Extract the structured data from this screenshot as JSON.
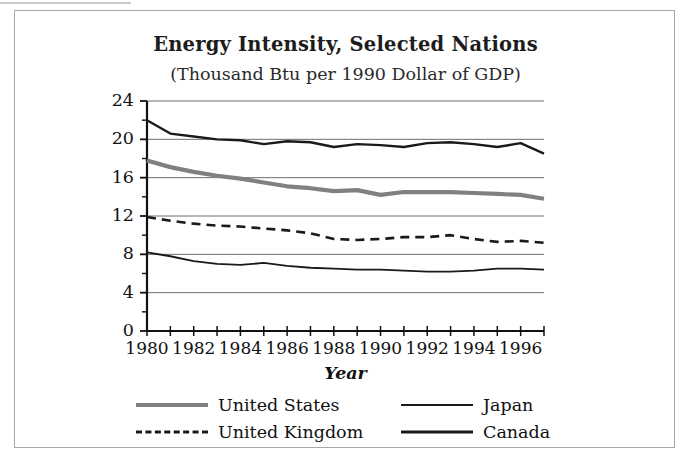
{
  "figure": {
    "title": "Energy Intensity, Selected Nations",
    "subtitle": "(Thousand Btu per 1990 Dollar of GDP)"
  },
  "axes": {
    "x_title": "Year",
    "y_tick_labels": [
      "24",
      "20",
      "16",
      "12",
      "8",
      "4",
      "0"
    ],
    "x_tick_labels": [
      "1980",
      "1982",
      "1984",
      "1986",
      "1988",
      "1990",
      "1992",
      "1994",
      "1996"
    ]
  },
  "legend": {
    "entries": [
      {
        "label": "United States",
        "style": "thick-solid-gray",
        "color": "#808080"
      },
      {
        "label": "Japan",
        "style": "thin-solid-black",
        "color": "#1a1a1a"
      },
      {
        "label": "United Kingdom",
        "style": "dashed-black",
        "color": "#1a1a1a"
      },
      {
        "label": "Canada",
        "style": "medium-solid-black",
        "color": "#1a1a1a"
      }
    ]
  },
  "chart_data": {
    "type": "line",
    "title": "Energy Intensity, Selected Nations",
    "subtitle": "(Thousand Btu per 1990 Dollar of GDP)",
    "xlabel": "Year",
    "ylabel": "",
    "xlim": [
      1980,
      1997
    ],
    "ylim": [
      0,
      24
    ],
    "y_ticks": [
      0,
      4,
      8,
      12,
      16,
      20,
      24
    ],
    "y_minor_tick_step": 2,
    "x_ticks": [
      1980,
      1981,
      1982,
      1983,
      1984,
      1985,
      1986,
      1987,
      1988,
      1989,
      1990,
      1991,
      1992,
      1993,
      1994,
      1995,
      1996,
      1997
    ],
    "x_tick_labels_shown": [
      1980,
      1982,
      1984,
      1986,
      1988,
      1990,
      1992,
      1994,
      1996
    ],
    "grid": "horizontal-major",
    "legend_position": "bottom",
    "x": [
      1980,
      1981,
      1982,
      1983,
      1984,
      1985,
      1986,
      1987,
      1988,
      1989,
      1990,
      1991,
      1992,
      1993,
      1994,
      1995,
      1996,
      1997
    ],
    "series": [
      {
        "name": "Canada",
        "color": "#1a1a1a",
        "style": "solid",
        "width": 2.4,
        "values": [
          22.0,
          20.6,
          20.3,
          20.0,
          19.9,
          19.5,
          19.8,
          19.7,
          19.2,
          19.5,
          19.4,
          19.2,
          19.6,
          19.7,
          19.5,
          19.2,
          19.6,
          18.5
        ]
      },
      {
        "name": "United States",
        "color": "#808080",
        "style": "solid",
        "width": 4.2,
        "values": [
          17.8,
          17.1,
          16.6,
          16.2,
          15.9,
          15.5,
          15.1,
          14.9,
          14.6,
          14.7,
          14.2,
          14.5,
          14.5,
          14.5,
          14.4,
          14.3,
          14.2,
          13.8
        ]
      },
      {
        "name": "United Kingdom",
        "color": "#1a1a1a",
        "style": "dashed",
        "width": 2.6,
        "values": [
          11.9,
          11.5,
          11.2,
          11.0,
          10.9,
          10.7,
          10.5,
          10.2,
          9.6,
          9.5,
          9.6,
          9.8,
          9.8,
          10.0,
          9.6,
          9.3,
          9.4,
          9.2
        ]
      },
      {
        "name": "Japan",
        "color": "#1a1a1a",
        "style": "solid",
        "width": 1.8,
        "values": [
          8.2,
          7.8,
          7.3,
          7.0,
          6.9,
          7.1,
          6.8,
          6.6,
          6.5,
          6.4,
          6.4,
          6.3,
          6.2,
          6.2,
          6.3,
          6.5,
          6.5,
          6.4
        ]
      }
    ]
  }
}
